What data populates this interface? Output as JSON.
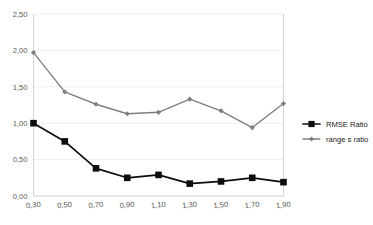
{
  "chart_data": {
    "type": "line",
    "title": "",
    "xlabel": "",
    "ylabel": "",
    "x": [
      0.3,
      0.5,
      0.7,
      0.9,
      1.1,
      1.3,
      1.5,
      1.7,
      1.9
    ],
    "xtick_labels": [
      "0,30",
      "0,50",
      "0,70",
      "0,90",
      "1,10",
      "1,30",
      "1,50",
      "1,70",
      "1,90"
    ],
    "ytick_labels": [
      "0,00",
      "0,50",
      "1,00",
      "1,50",
      "2,00",
      "2,50"
    ],
    "ytick_values": [
      0.0,
      0.5,
      1.0,
      1.5,
      2.0,
      2.5
    ],
    "ylim": [
      0.0,
      2.5
    ],
    "xlim": [
      0.3,
      1.9
    ],
    "grid": "horizontal",
    "legend_position": "right",
    "series": [
      {
        "name": "RMSE Ratio",
        "color": "#0d0d0d",
        "marker": "square",
        "values": [
          1.0,
          0.75,
          0.38,
          0.25,
          0.29,
          0.17,
          0.2,
          0.25,
          0.19
        ]
      },
      {
        "name": "range s ratio",
        "color": "#7f7f7f",
        "marker": "diamond",
        "values": [
          1.97,
          1.43,
          1.26,
          1.13,
          1.15,
          1.33,
          1.17,
          0.94,
          1.27
        ]
      }
    ]
  },
  "legend": {
    "items": [
      {
        "label": "RMSE Ratio"
      },
      {
        "label": "range s ratio"
      }
    ]
  }
}
